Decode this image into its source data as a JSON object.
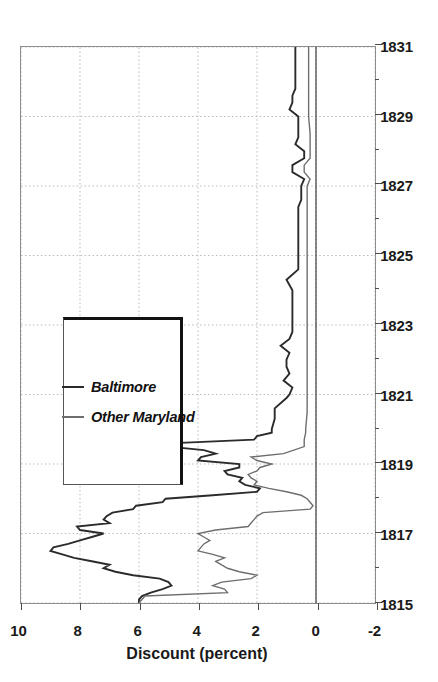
{
  "chart_data": {
    "type": "line",
    "title": "",
    "subtitle": "",
    "orientation": "rotated-90-ccw",
    "xlabel": "",
    "ylabel": "Discount (percent)",
    "xlim": [
      1815,
      1831
    ],
    "ylim": [
      -2,
      10
    ],
    "x_ticks": [
      1815,
      1817,
      1819,
      1821,
      1823,
      1825,
      1827,
      1829,
      1831
    ],
    "x_tick_labels": [
      "1815",
      "1817",
      "1819",
      "1821",
      "1823",
      "1825",
      "1827",
      "1829",
      "1831"
    ],
    "x_minor_ticks": [
      1816,
      1818,
      1820,
      1822,
      1824,
      1826,
      1828,
      1830
    ],
    "y_ticks": [
      -2,
      0,
      2,
      4,
      6,
      8,
      10
    ],
    "y_tick_labels": [
      "-2",
      "0",
      "2",
      "4",
      "6",
      "8",
      "10"
    ],
    "grid": {
      "x": true,
      "y": true,
      "style": "dotted",
      "color": "#b8b8b8"
    },
    "zero_line": {
      "value": 0,
      "color": "#3a3a3a",
      "width": 1.2
    },
    "legend": {
      "position": "upper-left-inside",
      "entries": [
        "Baltimore",
        "Other Maryland"
      ]
    },
    "colors": {
      "baltimore": "#2b2b2b",
      "other_maryland": "#6e6e6e"
    },
    "series": [
      {
        "name": "Baltimore",
        "color": "#2b2b2b",
        "width": 1.9,
        "x": [
          1815.0,
          1815.1,
          1815.2,
          1815.3,
          1815.4,
          1815.5,
          1815.6,
          1815.7,
          1815.8,
          1815.9,
          1816.0,
          1816.1,
          1816.2,
          1816.3,
          1816.4,
          1816.5,
          1816.6,
          1816.7,
          1816.8,
          1816.9,
          1817.0,
          1817.1,
          1817.2,
          1817.3,
          1817.4,
          1817.5,
          1817.6,
          1817.7,
          1817.8,
          1817.9,
          1818.0,
          1818.1,
          1818.2,
          1818.3,
          1818.4,
          1818.5,
          1818.6,
          1818.7,
          1818.8,
          1818.9,
          1819.0,
          1819.1,
          1819.2,
          1819.3,
          1819.4,
          1819.5,
          1819.6,
          1819.7,
          1819.8,
          1819.9,
          1820.0,
          1820.3,
          1820.6,
          1820.9,
          1821.0,
          1821.2,
          1821.4,
          1821.6,
          1821.8,
          1822.0,
          1822.2,
          1822.4,
          1822.6,
          1822.8,
          1823.0,
          1823.5,
          1824.0,
          1824.3,
          1824.6,
          1824.9,
          1825.0,
          1825.5,
          1826.0,
          1826.4,
          1826.6,
          1826.8,
          1827.0,
          1827.2,
          1827.4,
          1827.6,
          1827.8,
          1828.0,
          1828.2,
          1828.4,
          1828.6,
          1828.8,
          1829.0,
          1829.2,
          1829.4,
          1829.6,
          1829.8,
          1830.0,
          1830.4,
          1830.8,
          1831.0
        ],
        "y": [
          6.0,
          6.0,
          5.9,
          5.6,
          5.2,
          4.9,
          5.0,
          5.3,
          6.2,
          6.8,
          7.2,
          7.0,
          7.6,
          8.2,
          8.6,
          9.0,
          8.9,
          8.4,
          8.0,
          7.6,
          7.2,
          8.0,
          8.1,
          7.0,
          7.2,
          7.1,
          6.9,
          6.2,
          6.1,
          5.2,
          5.1,
          3.5,
          2.0,
          1.9,
          2.4,
          2.6,
          2.5,
          3.0,
          3.1,
          2.6,
          2.6,
          4.0,
          3.9,
          3.4,
          3.8,
          5.0,
          4.8,
          2.1,
          2.0,
          1.5,
          1.5,
          1.4,
          1.4,
          1.0,
          0.9,
          0.8,
          1.1,
          0.9,
          1.0,
          1.0,
          0.9,
          1.2,
          0.9,
          0.8,
          0.8,
          0.8,
          0.8,
          1.0,
          0.6,
          0.6,
          0.6,
          0.6,
          0.6,
          0.6,
          0.5,
          0.5,
          0.5,
          0.4,
          0.8,
          0.8,
          0.4,
          0.4,
          0.7,
          0.6,
          0.6,
          0.6,
          0.6,
          0.9,
          0.8,
          0.8,
          0.7,
          0.7,
          0.7,
          0.7,
          0.7
        ]
      },
      {
        "name": "Other Maryland",
        "color": "#6e6e6e",
        "width": 1.4,
        "x": [
          1815.0,
          1815.1,
          1815.2,
          1815.3,
          1815.4,
          1815.5,
          1815.6,
          1815.7,
          1815.8,
          1815.9,
          1816.0,
          1816.1,
          1816.2,
          1816.3,
          1816.4,
          1816.5,
          1816.6,
          1816.7,
          1816.8,
          1816.9,
          1817.0,
          1817.1,
          1817.2,
          1817.3,
          1817.4,
          1817.5,
          1817.6,
          1817.7,
          1817.8,
          1817.9,
          1818.0,
          1818.1,
          1818.2,
          1818.3,
          1818.4,
          1818.5,
          1818.6,
          1818.7,
          1818.8,
          1818.9,
          1819.0,
          1819.1,
          1819.2,
          1819.3,
          1819.5,
          1819.7,
          1819.9,
          1820.0,
          1820.5,
          1821.0,
          1821.5,
          1822.0,
          1822.5,
          1823.0,
          1823.5,
          1824.0,
          1824.5,
          1825.0,
          1825.5,
          1826.0,
          1826.5,
          1827.0,
          1827.2,
          1827.4,
          1827.6,
          1827.8,
          1828.0,
          1828.5,
          1829.0,
          1829.5,
          1830.0,
          1830.5,
          1831.0
        ],
        "y": [
          6.0,
          5.9,
          5.8,
          3.0,
          3.1,
          3.5,
          3.2,
          2.2,
          2.0,
          2.6,
          3.0,
          3.2,
          3.4,
          3.1,
          3.5,
          4.0,
          3.9,
          3.8,
          3.6,
          3.8,
          4.0,
          3.4,
          2.3,
          2.2,
          2.1,
          2.0,
          1.8,
          0.2,
          0.1,
          0.2,
          0.3,
          0.5,
          1.0,
          1.6,
          2.1,
          2.0,
          2.2,
          2.3,
          2.0,
          1.9,
          1.5,
          2.0,
          2.2,
          1.1,
          0.4,
          0.4,
          0.35,
          0.35,
          0.3,
          0.3,
          0.3,
          0.3,
          0.3,
          0.3,
          0.3,
          0.3,
          0.3,
          0.3,
          0.3,
          0.3,
          0.3,
          0.3,
          0.2,
          0.4,
          0.4,
          0.2,
          0.2,
          0.2,
          0.25,
          0.25,
          0.25,
          0.25,
          0.25
        ]
      }
    ]
  },
  "axis": {
    "y_title": "Discount (percent)"
  },
  "legend": {
    "entries": [
      {
        "label": "Baltimore"
      },
      {
        "label": "Other Maryland"
      }
    ]
  }
}
